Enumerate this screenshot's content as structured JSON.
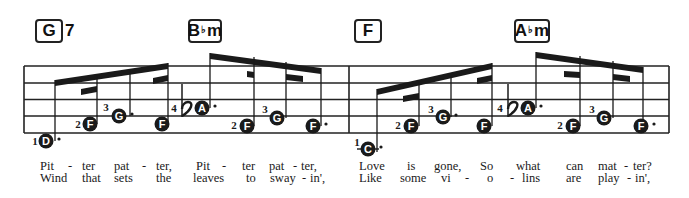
{
  "chords": [
    {
      "root": "G",
      "accidental": "",
      "quality": "",
      "extension": "7",
      "x": 35,
      "w": 28
    },
    {
      "root": "B",
      "accidental": "♭",
      "quality": "m",
      "extension": "",
      "x": 188,
      "w": 34
    },
    {
      "root": "F",
      "accidental": "",
      "quality": "",
      "extension": "",
      "x": 354,
      "w": 28
    },
    {
      "root": "A",
      "accidental": "♭",
      "quality": "m",
      "extension": "",
      "x": 514,
      "w": 36
    }
  ],
  "staff": {
    "left": 24,
    "right": 669,
    "lines_y": [
      66,
      83,
      99.5,
      116,
      133
    ],
    "barlines_x": [
      24,
      349,
      669
    ],
    "line_color": "#222222"
  },
  "notes": [
    {
      "letter": "D",
      "x": 46,
      "y": 141,
      "finger": "1",
      "fx": 35,
      "fy": 141,
      "dot": true,
      "ledger": false
    },
    {
      "letter": "F",
      "x": 90,
      "y": 124,
      "finger": "2",
      "fx": 78,
      "fy": 124,
      "dot": false,
      "ledger": false
    },
    {
      "letter": "G",
      "x": 119,
      "y": 116,
      "finger": "3",
      "fx": 106,
      "fy": 107,
      "dot": true,
      "ledger": false
    },
    {
      "letter": "F",
      "x": 162,
      "y": 124,
      "finger": "",
      "fx": 0,
      "fy": 0,
      "dot": false,
      "ledger": false
    },
    {
      "letter": "A",
      "x": 202,
      "y": 108,
      "finger": "4",
      "fx": 174,
      "fy": 108,
      "dot": true,
      "ledger": false
    },
    {
      "letter": "F",
      "x": 247,
      "y": 126,
      "finger": "2",
      "fx": 234,
      "fy": 125,
      "dot": false,
      "ledger": false
    },
    {
      "letter": "G",
      "x": 277,
      "y": 118,
      "finger": "3",
      "fx": 265,
      "fy": 109,
      "dot": false,
      "ledger": false
    },
    {
      "letter": "F",
      "x": 313,
      "y": 126,
      "finger": "",
      "fx": 0,
      "fy": 0,
      "dot": true,
      "ledger": false
    },
    {
      "letter": "C",
      "x": 368,
      "y": 149,
      "finger": "1",
      "fx": 357,
      "fy": 142,
      "dot": true,
      "ledger": true
    },
    {
      "letter": "F",
      "x": 411,
      "y": 126,
      "finger": "2",
      "fx": 398,
      "fy": 125,
      "dot": false,
      "ledger": false
    },
    {
      "letter": "G",
      "x": 443,
      "y": 117,
      "finger": "3",
      "fx": 431,
      "fy": 109,
      "dot": true,
      "ledger": false
    },
    {
      "letter": "F",
      "x": 484,
      "y": 126,
      "finger": "",
      "fx": 0,
      "fy": 0,
      "dot": false,
      "ledger": false
    },
    {
      "letter": "A",
      "x": 528,
      "y": 108,
      "finger": "4",
      "fx": 500,
      "fy": 108,
      "dot": true,
      "ledger": false
    },
    {
      "letter": "F",
      "x": 573,
      "y": 126,
      "finger": "2",
      "fx": 560,
      "fy": 125,
      "dot": false,
      "ledger": false
    },
    {
      "letter": "G",
      "x": 604,
      "y": 118,
      "finger": "3",
      "fx": 592,
      "fy": 109,
      "dot": false,
      "ledger": false
    },
    {
      "letter": "F",
      "x": 641,
      "y": 126,
      "finger": "",
      "fx": 0,
      "fy": 0,
      "dot": true,
      "ledger": false
    }
  ],
  "stems": [
    {
      "x": 55,
      "y1": 141,
      "y2": 80
    },
    {
      "x": 97,
      "y1": 124,
      "y2": 75
    },
    {
      "x": 130,
      "y1": 116,
      "y2": 70
    },
    {
      "x": 168,
      "y1": 124,
      "y2": 63
    },
    {
      "x": 210,
      "y1": 108,
      "y2": 53
    },
    {
      "x": 254,
      "y1": 126,
      "y2": 57
    },
    {
      "x": 286,
      "y1": 118,
      "y2": 62
    },
    {
      "x": 321,
      "y1": 126,
      "y2": 68
    },
    {
      "x": 377,
      "y1": 152,
      "y2": 89
    },
    {
      "x": 419,
      "y1": 126,
      "y2": 82
    },
    {
      "x": 451,
      "y1": 117,
      "y2": 76
    },
    {
      "x": 492,
      "y1": 126,
      "y2": 63
    },
    {
      "x": 536,
      "y1": 108,
      "y2": 52
    },
    {
      "x": 580,
      "y1": 126,
      "y2": 56
    },
    {
      "x": 613,
      "y1": 118,
      "y2": 61
    },
    {
      "x": 643,
      "y1": 126,
      "y2": 67
    }
  ],
  "beams": [
    {
      "x1": 55,
      "y1": 80,
      "x2": 168,
      "y2": 63,
      "h": 6
    },
    {
      "x1": 81,
      "y1": 89,
      "x2": 97,
      "y2": 86,
      "h": 6
    },
    {
      "x1": 153,
      "y1": 78,
      "x2": 168,
      "y2": 75,
      "h": 6
    },
    {
      "x1": 210,
      "y1": 53,
      "x2": 321,
      "y2": 68,
      "h": 6
    },
    {
      "x1": 247,
      "y1": 71,
      "x2": 254,
      "y2": 72,
      "h": 6
    },
    {
      "x1": 286,
      "y1": 74,
      "x2": 303,
      "y2": 76,
      "h": 6
    },
    {
      "x1": 377,
      "y1": 89,
      "x2": 492,
      "y2": 63,
      "h": 6
    },
    {
      "x1": 403,
      "y1": 96,
      "x2": 419,
      "y2": 93,
      "h": 6
    },
    {
      "x1": 477,
      "y1": 78,
      "x2": 492,
      "y2": 75,
      "h": 6
    },
    {
      "x1": 536,
      "y1": 52,
      "x2": 643,
      "y2": 67,
      "h": 6
    },
    {
      "x1": 564,
      "y1": 71,
      "x2": 580,
      "y2": 72,
      "h": 6
    },
    {
      "x1": 613,
      "y1": 74,
      "x2": 630,
      "y2": 76,
      "h": 6
    }
  ],
  "flats": [
    {
      "x": 182,
      "y": 108
    },
    {
      "x": 508,
      "y": 108
    }
  ],
  "lyrics": {
    "verse1": [
      {
        "text": "Pit",
        "x": 40
      },
      {
        "text": "-",
        "x": 68
      },
      {
        "text": "ter",
        "x": 82
      },
      {
        "text": "pat",
        "x": 114
      },
      {
        "text": "-",
        "x": 142
      },
      {
        "text": "ter,",
        "x": 156
      },
      {
        "text": "Pit",
        "x": 196
      },
      {
        "text": "-",
        "x": 222
      },
      {
        "text": "ter",
        "x": 242
      },
      {
        "text": "pat",
        "x": 269
      },
      {
        "text": "-",
        "x": 293
      },
      {
        "text": "ter,",
        "x": 301
      },
      {
        "text": "Love",
        "x": 359
      },
      {
        "text": "is",
        "x": 407
      },
      {
        "text": "gone,",
        "x": 434
      },
      {
        "text": "So",
        "x": 480
      },
      {
        "text": "what",
        "x": 516
      },
      {
        "text": "can",
        "x": 566
      },
      {
        "text": "mat",
        "x": 598
      },
      {
        "text": "-",
        "x": 624
      },
      {
        "text": "ter?",
        "x": 633
      }
    ],
    "verse2": [
      {
        "text": "Wind",
        "x": 40
      },
      {
        "text": "that",
        "x": 82
      },
      {
        "text": "sets",
        "x": 114
      },
      {
        "text": "the",
        "x": 156
      },
      {
        "text": "leaves",
        "x": 193
      },
      {
        "text": "to",
        "x": 246
      },
      {
        "text": "sway",
        "x": 270
      },
      {
        "text": "-",
        "x": 302
      },
      {
        "text": "in',",
        "x": 310
      },
      {
        "text": "Like",
        "x": 359
      },
      {
        "text": "some",
        "x": 400
      },
      {
        "text": "vi",
        "x": 441
      },
      {
        "text": "-",
        "x": 465
      },
      {
        "text": "o",
        "x": 487
      },
      {
        "text": "-",
        "x": 510
      },
      {
        "text": "lins",
        "x": 522
      },
      {
        "text": "are",
        "x": 566
      },
      {
        "text": "play",
        "x": 598
      },
      {
        "text": "-",
        "x": 627
      },
      {
        "text": "in',",
        "x": 635
      }
    ],
    "y1": 160,
    "y2": 172
  },
  "colors": {
    "ink": "#1a1a1a",
    "paper": "#ffffff"
  }
}
